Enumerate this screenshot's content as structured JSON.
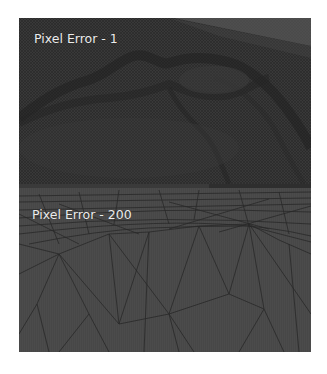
{
  "figure": {
    "panels": [
      {
        "label": "Pixel Error - 1",
        "description": "dense wireframe terrain mesh",
        "colors": {
          "mesh": "#353535",
          "sky": "#5a5a5a",
          "ridge": "#1e1e1e"
        }
      },
      {
        "label": "Pixel Error - 200",
        "description": "sparse triangulated terrain mesh",
        "colors": {
          "mesh": "#4a4a4a",
          "edges": "#1f1f1f"
        }
      }
    ]
  }
}
